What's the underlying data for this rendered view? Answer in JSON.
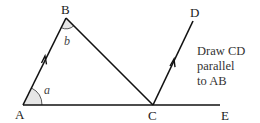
{
  "points": {
    "A": "A",
    "B": "B",
    "C": "C",
    "D": "D",
    "E": "E"
  },
  "angles": {
    "a": "a",
    "b": "b"
  },
  "instruction": [
    "Draw CD",
    "parallel",
    "to AB"
  ],
  "colors": {
    "line": "#111111",
    "angle_fill": "#e6e6e6"
  }
}
